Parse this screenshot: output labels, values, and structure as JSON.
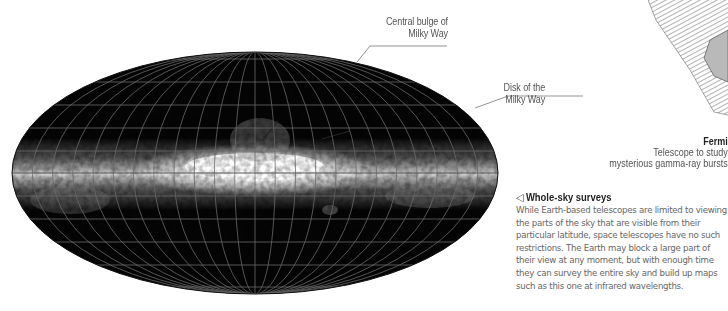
{
  "map": {
    "description": "All-sky infrared map in elliptical (Mollweide) projection with grid",
    "projection": "mollweide",
    "center": [
      255,
      173
    ],
    "radius_x": 243,
    "radius_y": 121,
    "meridian_count": 24,
    "parallel_count": 10,
    "colors": {
      "sky": "#050505",
      "grid": "#6a6a6a",
      "galactic_band": "#f2f2f2"
    }
  },
  "callouts": {
    "bulge": {
      "line1": "Central bulge of",
      "line2": "Milky Way"
    },
    "disk": {
      "line1": "Disk of the",
      "line2": "Milky Way"
    }
  },
  "fermi": {
    "title": "Fermi",
    "line1": "Telescope to study",
    "line2": "mysterious gamma-ray bursts"
  },
  "survey": {
    "icon": "left-triangle-icon",
    "icon_glyph": "◁",
    "title": "Whole-sky surveys",
    "body": "While Earth-based telescopes are limited to viewing the parts of the sky that are visible from their particular latitude, space telescopes have no such restrictions. The Earth may block a large part of their view at any moment, but with enough time they can survey the entire sky and build up maps such as this one at infrared wavelengths."
  }
}
